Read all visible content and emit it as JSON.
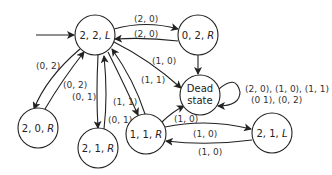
{
  "diagram": {
    "type": "state-transition",
    "nodes": [
      {
        "id": "s22L",
        "label": "2, 2, ",
        "dir": "L",
        "x": 95,
        "y": 35
      },
      {
        "id": "s02R",
        "label": "0, 2, ",
        "dir": "R",
        "x": 198,
        "y": 35
      },
      {
        "id": "dead",
        "line1": "Dead",
        "line2": "state",
        "x": 200,
        "y": 95
      },
      {
        "id": "s20R",
        "label": "2, 0, ",
        "dir": "R",
        "x": 38,
        "y": 128
      },
      {
        "id": "s21R",
        "label": "2, 1, ",
        "dir": "R",
        "x": 98,
        "y": 148
      },
      {
        "id": "s11R",
        "label": "1, 1, ",
        "dir": "R",
        "x": 146,
        "y": 134
      },
      {
        "id": "s21L",
        "label": "2, 1, ",
        "dir": "L",
        "x": 272,
        "y": 133
      }
    ],
    "edges": [
      {
        "from": "start",
        "to": "s22L",
        "label": ""
      },
      {
        "from": "s22L",
        "to": "s02R",
        "label": "(2, 0)"
      },
      {
        "from": "s02R",
        "to": "s22L",
        "label": "(2, 0)"
      },
      {
        "from": "s22L",
        "to": "s20R",
        "label": "(0, 2)"
      },
      {
        "from": "s20R",
        "to": "s22L",
        "label": "(0, 2)"
      },
      {
        "from": "s22L",
        "to": "s21R",
        "label": "(0, 1)"
      },
      {
        "from": "s21R",
        "to": "s22L",
        "label": "(0, 1)"
      },
      {
        "from": "s22L",
        "to": "s11R",
        "label": "(1, 1)"
      },
      {
        "from": "s11R",
        "to": "s22L",
        "label": "(1, 1)"
      },
      {
        "from": "s22L",
        "to": "dead",
        "label": "(1, 0)"
      },
      {
        "from": "s02R",
        "to": "dead",
        "label": ""
      },
      {
        "from": "s11R",
        "to": "dead",
        "label": "(1, 0)"
      },
      {
        "from": "s11R",
        "to": "s21L",
        "label": "(1, 0)"
      },
      {
        "from": "s21L",
        "to": "s11R",
        "label": "(1, 0)"
      },
      {
        "from": "dead",
        "to": "dead",
        "label_line1": "(2, 0), (1, 0), (1, 1)",
        "label_line2": "(0  1), (0, 2)"
      }
    ]
  }
}
